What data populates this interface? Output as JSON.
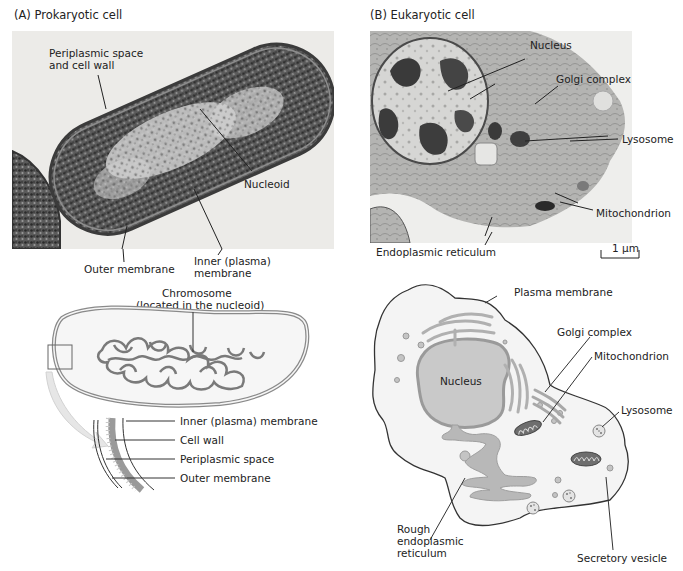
{
  "panels": {
    "a": {
      "title": "(A)  Prokaryotic cell",
      "micrograph_labels": {
        "periplasmic_l1": "Periplasmic space",
        "periplasmic_l2": "and cell wall",
        "nucleoid": "Nucleoid",
        "outer_membrane": "Outer membrane",
        "inner_l1": "Inner (plasma)",
        "inner_l2": "membrane"
      },
      "diagram_labels": {
        "chromosome_l1": "Chromosome",
        "chromosome_l2": "(located in the nucleoid)",
        "inner_membrane": "Inner (plasma) membrane",
        "cell_wall": "Cell wall",
        "periplasmic_space": "Periplasmic space",
        "outer_membrane": "Outer membrane"
      }
    },
    "b": {
      "title": "(B)  Eukaryotic cell",
      "micrograph_labels": {
        "nucleus": "Nucleus",
        "golgi": "Golgi complex",
        "lysosome": "Lysosome",
        "mitochondrion": "Mitochondrion",
        "er": "Endoplasmic reticulum",
        "scale_bar": "1 μm"
      },
      "diagram_labels": {
        "plasma_membrane": "Plasma membrane",
        "golgi": "Golgi complex",
        "mitochondrion": "Mitochondrion",
        "nucleus": "Nucleus",
        "lysosome": "Lysosome",
        "rough_er_l1": "Rough",
        "rough_er_l2": "endoplasmic",
        "rough_er_l3": "reticulum",
        "secretory_vesicle": "Secretory vesicle"
      }
    }
  },
  "colors": {
    "em_bg": "#e9e9e6",
    "em_dark": "#3a3a3a",
    "diagram_fill": "#f3f3f3",
    "organelle_gray": "#b9b9b9",
    "stroke": "#333333"
  }
}
